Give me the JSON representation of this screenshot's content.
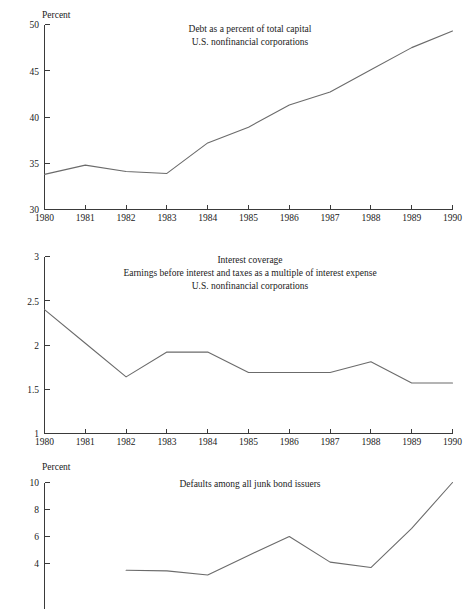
{
  "page": {
    "background_color": "#ffffff",
    "line_color": "#6b6b6b",
    "axis_color": "#3a3a3a",
    "text_color": "#1a1a1a"
  },
  "charts": [
    {
      "id": "debt-percent-total-capital",
      "title_lines": [
        "Debt as a percent of total capital",
        "U.S. nonfinancial corporations"
      ],
      "y_unit_label": "Percent",
      "chart_data": {
        "type": "line",
        "title": "Debt as a percent of total capital / U.S. nonfinancial corporations",
        "xlabel": "",
        "ylabel": "Percent",
        "x": [
          1980,
          1981,
          1982,
          1983,
          1984,
          1985,
          1986,
          1987,
          1988,
          1989,
          1990
        ],
        "values": [
          33.8,
          34.8,
          34.1,
          33.9,
          37.2,
          38.9,
          41.3,
          42.7,
          45.1,
          47.5,
          49.3
        ],
        "xlim": [
          1980,
          1990
        ],
        "ylim": [
          30,
          50
        ],
        "yticks": [
          30,
          35,
          40,
          45,
          50
        ],
        "ytick_labels": [
          "30",
          "35",
          "40",
          "45",
          "50"
        ],
        "xticks": [
          1980,
          1981,
          1982,
          1983,
          1984,
          1985,
          1986,
          1987,
          1988,
          1989,
          1990
        ],
        "xtick_labels": [
          "1980",
          "1981",
          "1982",
          "1983",
          "1984",
          "1985",
          "1986",
          "1987",
          "1988",
          "1989",
          "1990"
        ],
        "grid": false,
        "legend": "none"
      }
    },
    {
      "id": "interest-coverage",
      "title_lines": [
        "Interest coverage",
        "Earnings before interest and taxes as a multiple of interest expense",
        "U.S. nonfinancial corporations"
      ],
      "y_unit_label": "",
      "chart_data": {
        "type": "line",
        "title": "Interest coverage / Earnings before interest and taxes as a multiple of interest expense / U.S. nonfinancial corporations",
        "xlabel": "",
        "ylabel": "",
        "x": [
          1980,
          1981,
          1982,
          1983,
          1984,
          1985,
          1986,
          1987,
          1988,
          1989,
          1990
        ],
        "values": [
          2.4,
          2.02,
          1.64,
          1.92,
          1.92,
          1.69,
          1.69,
          1.69,
          1.81,
          1.57,
          1.57
        ],
        "xlim": [
          1980,
          1990
        ],
        "ylim": [
          1,
          3
        ],
        "yticks": [
          1,
          1.5,
          2,
          2.5,
          3
        ],
        "ytick_labels": [
          "1",
          "1.5",
          "2",
          "2.5",
          "3"
        ],
        "xticks": [
          1980,
          1981,
          1982,
          1983,
          1984,
          1985,
          1986,
          1987,
          1988,
          1989,
          1990
        ],
        "xtick_labels": [
          "1980",
          "1981",
          "1982",
          "1983",
          "1984",
          "1985",
          "1986",
          "1987",
          "1988",
          "1989",
          "1990"
        ],
        "grid": false,
        "legend": "none"
      }
    },
    {
      "id": "defaults-junk-bond-issuers",
      "title_lines": [
        "Defaults among all junk bond issuers"
      ],
      "y_unit_label": "Percent",
      "chart_data": {
        "type": "line",
        "title": "Defaults among all junk bond issuers",
        "xlabel": "",
        "ylabel": "Percent",
        "x": [
          1982,
          1983,
          1984,
          1985,
          1986,
          1987,
          1988,
          1989,
          1990
        ],
        "values": [
          3.5,
          3.45,
          3.15,
          4.6,
          6.0,
          4.1,
          3.7,
          6.6,
          10.0
        ],
        "xlim": [
          1980,
          1990
        ],
        "ylim": [
          3,
          10
        ],
        "yticks": [
          4,
          6,
          8,
          10
        ],
        "ytick_labels": [
          "4",
          "6",
          "8",
          "10"
        ],
        "xticks": [],
        "xtick_labels": [],
        "grid": false,
        "legend": "none",
        "note": "bottom of plot is cropped by the screenshot edge"
      }
    }
  ]
}
